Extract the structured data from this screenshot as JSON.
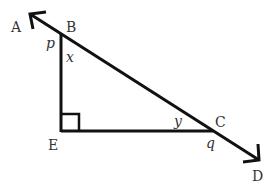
{
  "diagram": {
    "type": "geometry",
    "colors": {
      "stroke": "#111111",
      "text": "#333333",
      "background": "#ffffff"
    },
    "points": {
      "A": {
        "label": "A"
      },
      "B": {
        "label": "B"
      },
      "C": {
        "label": "C"
      },
      "D": {
        "label": "D"
      },
      "E": {
        "label": "E"
      }
    },
    "angles": {
      "p": {
        "label": "p",
        "at": "B",
        "between": "AB and BE"
      },
      "x": {
        "label": "x",
        "at": "B",
        "between": "BE and BC"
      },
      "y": {
        "label": "y",
        "at": "C",
        "between": "CB and CE"
      },
      "q": {
        "label": "q",
        "at": "C",
        "between": "EC and CD"
      }
    },
    "right_angle_at": "E",
    "segments": [
      "AD",
      "BE",
      "EC"
    ],
    "arrows": [
      "A",
      "D"
    ]
  }
}
